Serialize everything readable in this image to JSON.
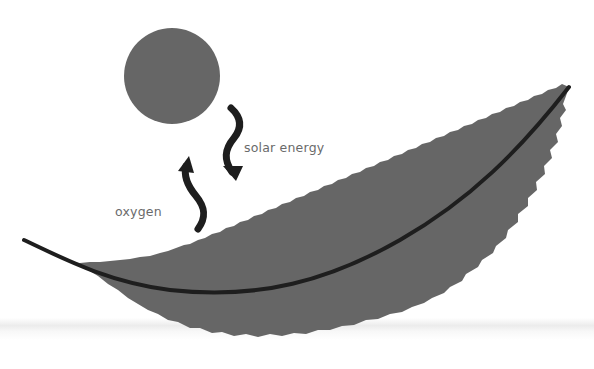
{
  "diagram": {
    "type": "photosynthesis-illustration",
    "elements": {
      "sun": {
        "shape": "circle",
        "color": "#666666"
      },
      "leaf": {
        "color": "#666666",
        "midrib_color": "#1e1e1e"
      },
      "arrows": [
        {
          "id": "solar-energy-arrow",
          "direction": "down",
          "from": "sun",
          "to": "leaf"
        },
        {
          "id": "oxygen-arrow",
          "direction": "up",
          "from": "leaf",
          "to": "air"
        }
      ]
    },
    "labels": {
      "solar_energy": "solar energy",
      "oxygen": "oxygen"
    },
    "colors": {
      "background": "#ffffff",
      "shape_fill": "#666666",
      "arrow": "#1e1e1e",
      "label_text": "#6a6a6a"
    }
  }
}
